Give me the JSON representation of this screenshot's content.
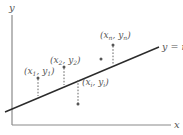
{
  "diagram": {
    "colors": {
      "axis": "#8a8a8a",
      "line": "#2b2b2b",
      "dash": "#666666",
      "text": "#555555"
    },
    "axes": {
      "x_label": "x",
      "y_label": "y"
    },
    "fit_line": {
      "label": "y = mx + b"
    },
    "points": [
      {
        "id": "p1",
        "label_main": "(x",
        "sub1": "1",
        "mid": ", y",
        "sub2": "1",
        "end": ")"
      },
      {
        "id": "p2",
        "label_main": "(x",
        "sub1": "2",
        "mid": ", y",
        "sub2": "2",
        "end": ")"
      },
      {
        "id": "pi",
        "label_main": "(x",
        "sub1": "i",
        "mid": ", y",
        "sub2": "i",
        "end": ")"
      },
      {
        "id": "pk",
        "label_main": "",
        "sub1": "",
        "mid": "",
        "sub2": "",
        "end": ""
      },
      {
        "id": "pn",
        "label_main": "(x",
        "sub1": "n",
        "mid": ", y",
        "sub2": "n",
        "end": ")"
      }
    ]
  }
}
